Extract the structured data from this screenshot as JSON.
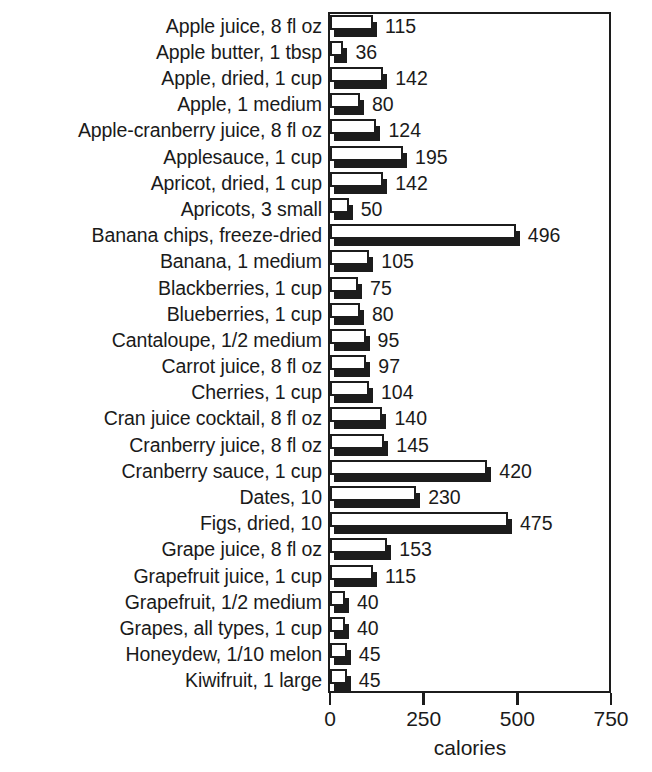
{
  "chart_data": {
    "type": "bar",
    "orientation": "horizontal",
    "title": "",
    "xlabel": "calories",
    "ylabel": "",
    "xlim": [
      0,
      750
    ],
    "xticks": [
      0,
      250,
      500,
      750
    ],
    "grid": false,
    "legend": null,
    "value_labels_shown": true,
    "categories": [
      "Apple juice, 8 fl oz",
      "Apple butter, 1 tbsp",
      "Apple, dried, 1 cup",
      "Apple, 1 medium",
      "Apple-cranberry juice, 8 fl oz",
      "Applesauce, 1 cup",
      "Apricot, dried, 1 cup",
      "Apricots, 3 small",
      "Banana chips, freeze-dried",
      "Banana, 1 medium",
      "Blackberries, 1 cup",
      "Blueberries, 1 cup",
      "Cantaloupe, 1/2 medium",
      "Carrot juice, 8 fl oz",
      "Cherries, 1 cup",
      "Cran juice cocktail, 8 fl oz",
      "Cranberry juice, 8 fl oz",
      "Cranberry sauce, 1 cup",
      "Dates, 10",
      "Figs, dried, 10",
      "Grape juice, 8 fl oz",
      "Grapefruit juice, 1 cup",
      "Grapefruit, 1/2 medium",
      "Grapes, all types, 1 cup",
      "Honeydew, 1/10 melon",
      "Kiwifruit, 1 large"
    ],
    "values": [
      115,
      36,
      142,
      80,
      124,
      195,
      142,
      50,
      496,
      105,
      75,
      80,
      95,
      97,
      104,
      140,
      145,
      420,
      230,
      475,
      153,
      115,
      40,
      40,
      45,
      45
    ],
    "value_label_texts": [
      "115",
      "36",
      "142",
      "80",
      "124",
      "195",
      "142",
      "50",
      "496",
      "105",
      "75",
      "80",
      "95",
      "97",
      "104",
      "140",
      "145",
      "420",
      "230",
      "475",
      "153",
      "115",
      "40",
      "40",
      "45",
      "45"
    ],
    "xtick_labels": [
      "0",
      "250",
      "500",
      "750"
    ],
    "colors": {
      "bar_face": "#ffffff",
      "bar_outline": "#1c1c1c",
      "bar_shadow": "#1c1c1c",
      "text": "#1a1a1a",
      "frame": "#1c1c1c",
      "background": "#ffffff"
    }
  }
}
